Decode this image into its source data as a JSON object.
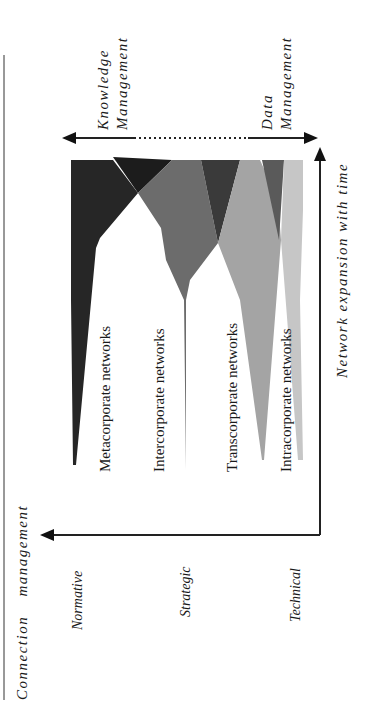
{
  "diagram": {
    "left_border": "line",
    "top_arrow": {
      "left_label_line1": "Knowledge",
      "left_label_line2": "Management",
      "right_label_line1": "Data",
      "right_label_line2": "Management",
      "style": "double-headed arrow with dotted middle segment"
    },
    "x_axis_label": "Network expansion with time",
    "y_axis_label_part1": "Connection",
    "y_axis_label_part2": "management",
    "levels": [
      "Normative",
      "Strategic",
      "Technical"
    ],
    "networks": [
      {
        "label": "Metacorporate networks",
        "color": "#2a2a2a"
      },
      {
        "label": "Intercorporate networks",
        "color": "#6a6a6a"
      },
      {
        "label": "Transcorporate networks",
        "color": "#9a9a9a"
      },
      {
        "label": "Intracorporate networks",
        "color": "#c4c4c4"
      }
    ],
    "colors": {
      "darkest": "#1e1e1e",
      "dark": "#3a3a3a",
      "mid": "#6e6e6e",
      "light": "#a2a2a2",
      "lightest": "#c8c8c8",
      "line": "#222222"
    }
  }
}
